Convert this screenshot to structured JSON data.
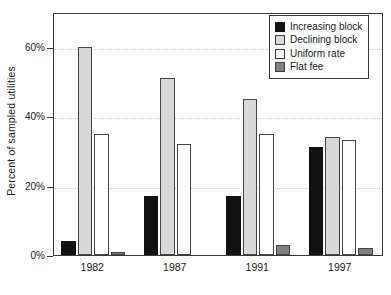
{
  "chart_data": {
    "type": "bar",
    "title": "",
    "subtitle": "",
    "xlabel": "",
    "ylabel": "Percent of sampled utilities",
    "categories": [
      "1982",
      "1987",
      "1991",
      "1997"
    ],
    "series": [
      {
        "name": "Increasing block",
        "color": "#111111",
        "values": [
          4,
          17,
          17,
          31
        ]
      },
      {
        "name": "Declining block",
        "color": "#d8d8d8",
        "values": [
          60,
          51,
          45,
          34
        ]
      },
      {
        "name": "Uniform rate",
        "color": "#ffffff",
        "values": [
          35,
          32,
          35,
          33
        ]
      },
      {
        "name": "Flat fee",
        "color": "#808080",
        "values": [
          1,
          0,
          3,
          2
        ]
      }
    ],
    "ylim": [
      0,
      70
    ],
    "yticks": [
      0,
      20,
      40,
      60
    ],
    "ytick_labels": [
      "0%",
      "20%",
      "40%",
      "60%"
    ],
    "grid": true,
    "grid_axis": "y",
    "legend_position": "top-right",
    "units": "percent"
  },
  "legend": {
    "entries": [
      {
        "label": "Increasing block"
      },
      {
        "label": "Declining block"
      },
      {
        "label": "Uniform rate"
      },
      {
        "label": "Flat fee"
      }
    ]
  },
  "axes": {
    "y_title": "Percent of sampled utilities"
  }
}
